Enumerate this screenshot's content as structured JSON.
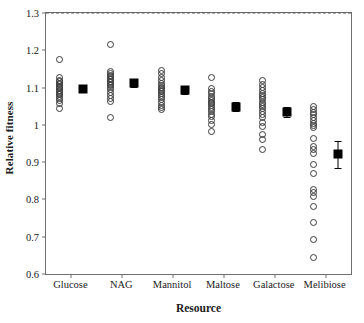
{
  "chart_data": {
    "type": "scatter",
    "title": "",
    "xlabel": "Resource",
    "ylabel": "Relative fitness",
    "grid": false,
    "legend": "none",
    "ylim": [
      0.6,
      1.3
    ],
    "yticks": [
      0.6,
      0.7,
      0.8,
      0.9,
      1,
      1.1,
      1.2,
      1.3
    ],
    "ytick_labels": [
      "0.6",
      "0.7",
      "0.8",
      "0.9",
      "1",
      "1.1",
      "1.2",
      "1.3"
    ],
    "categories": [
      "Glucose",
      "NAG",
      "Mannitol",
      "Maltose",
      "Galactose",
      "Melibiose"
    ],
    "reference_line": {
      "y": 1.0,
      "style": "dashed",
      "color": "#585858"
    },
    "marker_styles": {
      "points": "open-circle",
      "mean": "filled-square-with-error-bars"
    },
    "series": [
      {
        "name": "Glucose",
        "points": [
          1.175,
          1.128,
          1.12,
          1.115,
          1.112,
          1.107,
          1.103,
          1.1,
          1.097,
          1.093,
          1.089,
          1.085,
          1.081,
          1.076,
          1.07,
          1.064,
          1.056,
          1.045
        ],
        "mean": 1.095,
        "error_low": 1.087,
        "error_high": 1.104
      },
      {
        "name": "NAG",
        "points": [
          1.215,
          1.142,
          1.138,
          1.133,
          1.129,
          1.125,
          1.121,
          1.117,
          1.113,
          1.109,
          1.105,
          1.1,
          1.094,
          1.088,
          1.08,
          1.071,
          1.062,
          1.021
        ],
        "mean": 1.113,
        "error_low": 1.102,
        "error_high": 1.124
      },
      {
        "name": "Mannitol",
        "points": [
          1.145,
          1.138,
          1.126,
          1.119,
          1.112,
          1.106,
          1.101,
          1.097,
          1.093,
          1.089,
          1.085,
          1.08,
          1.074,
          1.068,
          1.061,
          1.053,
          1.046,
          1.04
        ],
        "mean": 1.093,
        "error_low": 1.082,
        "error_high": 1.104
      },
      {
        "name": "Maltose",
        "points": [
          1.128,
          1.098,
          1.09,
          1.083,
          1.077,
          1.071,
          1.066,
          1.061,
          1.056,
          1.051,
          1.046,
          1.041,
          1.035,
          1.029,
          1.022,
          1.013,
          1.002,
          0.981
        ],
        "mean": 1.048,
        "error_low": 1.036,
        "error_high": 1.06
      },
      {
        "name": "Galactose",
        "points": [
          1.118,
          1.108,
          1.1,
          1.092,
          1.085,
          1.079,
          1.073,
          1.067,
          1.061,
          1.055,
          1.049,
          1.043,
          1.036,
          1.028,
          1.019,
          1.007,
          0.996,
          0.973,
          0.961,
          0.934
        ],
        "mean": 1.035,
        "error_low": 1.021,
        "error_high": 1.049
      },
      {
        "name": "Melibiose",
        "points": [
          1.048,
          1.04,
          1.033,
          1.027,
          1.02,
          1.012,
          1.004,
          0.998,
          0.994,
          0.963,
          0.941,
          0.933,
          0.922,
          0.895,
          0.869,
          0.826,
          0.818,
          0.807,
          0.781,
          0.739,
          0.692,
          0.643
        ],
        "mean": 0.921,
        "error_low": 0.885,
        "error_high": 0.957
      }
    ]
  }
}
